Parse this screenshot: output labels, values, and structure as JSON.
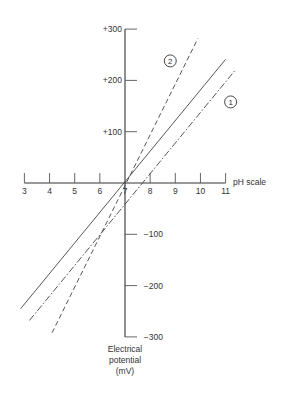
{
  "chart_data": {
    "type": "line",
    "title": "",
    "xlabel": "pH scale",
    "ylabel": "Electrical potential (mV)",
    "ylabel_lines": [
      "Electrical",
      "potential",
      "(mV)"
    ],
    "xlim": [
      3,
      11
    ],
    "ylim": [
      -300,
      300
    ],
    "x_ticks": [
      3,
      4,
      5,
      6,
      7,
      8,
      9,
      10,
      11
    ],
    "y_ticks": [
      300,
      200,
      100,
      -100,
      -200,
      -300
    ],
    "y_tick_labels": [
      "+300",
      "+200",
      "+100",
      "−100",
      "−200",
      "−300"
    ],
    "grid": false,
    "legend": "inline circled numbers",
    "annotations": [
      {
        "text": "1",
        "near": "dash-dot line",
        "x": 11.2,
        "y": 158
      },
      {
        "text": "2",
        "near": "dashed line",
        "x": 8.8,
        "y": 238
      }
    ],
    "series": [
      {
        "name": "ideal (solid)",
        "style": "solid",
        "slope_mV_per_pH": 59,
        "x": [
          2.85,
          11.0
        ],
        "y": [
          -245,
          241
        ]
      },
      {
        "name": "1 (offset)",
        "style": "dash-dot",
        "slope_mV_per_pH": 59,
        "x": [
          3.2,
          11.4
        ],
        "y": [
          -268,
          221
        ]
      },
      {
        "name": "2 (slope error)",
        "style": "dashed",
        "slope_mV_per_pH": 99,
        "x": [
          4.1,
          9.9
        ],
        "y": [
          -292,
          282
        ]
      }
    ]
  }
}
